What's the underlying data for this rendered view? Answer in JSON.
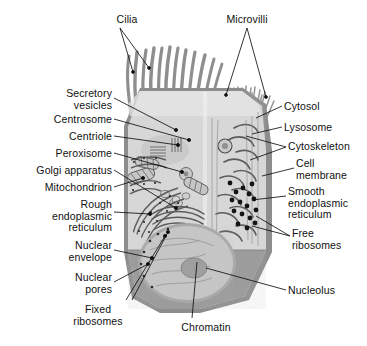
{
  "figure": {
    "background_color": "#ffffff",
    "width": 367,
    "height": 346
  },
  "palette": {
    "page_background": "#ffffff",
    "cytoplasm": "#d9d9d9",
    "cytoplasm_light": "#e4e4e4",
    "cut_surface": "#9a9a9a",
    "cell_membrane": "#8d8d8d",
    "nucleoplasm": "#c4c4c4",
    "nucleolus": "#b0b0b0",
    "organelle_stroke": "#6e6e6e",
    "ribosome_dot": "#1c1c1c",
    "leader_line": "#111111",
    "label_text": "#111111"
  },
  "labels": [
    {
      "id": "cilia",
      "text": "Cilia",
      "side": "top",
      "align": "c",
      "x": 104,
      "y": 14,
      "width": 46
    },
    {
      "id": "microvilli",
      "text": "Microvilli",
      "side": "top",
      "align": "c",
      "x": 214,
      "y": 14,
      "width": 66
    },
    {
      "id": "secretory-vesicles",
      "text": "Secretory\nvesicles",
      "side": "left",
      "align": "r",
      "x": 24,
      "y": 88,
      "width": 88
    },
    {
      "id": "centrosome",
      "text": "Centrosome",
      "side": "left",
      "align": "r",
      "x": 24,
      "y": 114,
      "width": 88
    },
    {
      "id": "centriole",
      "text": "Centriole",
      "side": "left",
      "align": "r",
      "x": 24,
      "y": 131,
      "width": 88
    },
    {
      "id": "peroxisome",
      "text": "Peroxisome",
      "side": "left",
      "align": "r",
      "x": 20,
      "y": 148,
      "width": 92
    },
    {
      "id": "golgi-apparatus",
      "text": "Golgi apparatus",
      "side": "left",
      "align": "r",
      "x": 8,
      "y": 165,
      "width": 104
    },
    {
      "id": "mitochondrion",
      "text": "Mitochondrion",
      "side": "left",
      "align": "r",
      "x": 12,
      "y": 182,
      "width": 100
    },
    {
      "id": "rough-er",
      "text": "Rough\nendoplasmic\nreticulum",
      "side": "left",
      "align": "r",
      "x": 18,
      "y": 199,
      "width": 94
    },
    {
      "id": "nuclear-envelope",
      "text": "Nuclear\nenvelope",
      "side": "left",
      "align": "r",
      "x": 28,
      "y": 240,
      "width": 84
    },
    {
      "id": "nuclear-pores",
      "text": "Nuclear\npores",
      "side": "left",
      "align": "r",
      "x": 36,
      "y": 272,
      "width": 76
    },
    {
      "id": "fixed-ribosomes",
      "text": "Fixed\nribosomes",
      "side": "left",
      "align": "c",
      "x": 62,
      "y": 304,
      "width": 72
    },
    {
      "id": "chromatin",
      "text": "Chromatin",
      "side": "bottom",
      "align": "c",
      "x": 174,
      "y": 322,
      "width": 64
    },
    {
      "id": "cytosol",
      "text": "Cytosol",
      "side": "right",
      "align": "l",
      "x": 284,
      "y": 101,
      "width": 76
    },
    {
      "id": "lysosome",
      "text": "Lysosome",
      "side": "right",
      "align": "l",
      "x": 284,
      "y": 122,
      "width": 76
    },
    {
      "id": "cytoskeleton",
      "text": "Cytoskeleton",
      "side": "right",
      "align": "l",
      "x": 288,
      "y": 141,
      "width": 76
    },
    {
      "id": "cell-membrane",
      "text": "Cell\nmembrane",
      "side": "right",
      "align": "l",
      "x": 296,
      "y": 158,
      "width": 68
    },
    {
      "id": "smooth-er",
      "text": "Smooth\nendoplasmic\nreticulum",
      "side": "right",
      "align": "l",
      "x": 288,
      "y": 186,
      "width": 76
    },
    {
      "id": "free-ribosomes",
      "text": "Free\nribosomes",
      "side": "right",
      "align": "l",
      "x": 292,
      "y": 228,
      "width": 72
    },
    {
      "id": "nucleolus",
      "text": "Nucleolus",
      "side": "right",
      "align": "l",
      "x": 288,
      "y": 285,
      "width": 72
    }
  ],
  "structures": {
    "cilia": "long tapered hair-like projections on the upper left of the apical surface",
    "microvilli": "short dense finger-like projections on the upper right of the apical surface",
    "nucleus": "large central-lower oval containing chromatin and a nucleolus",
    "cut_surface": "darker grey wedge showing the sectioned base of the cell"
  }
}
